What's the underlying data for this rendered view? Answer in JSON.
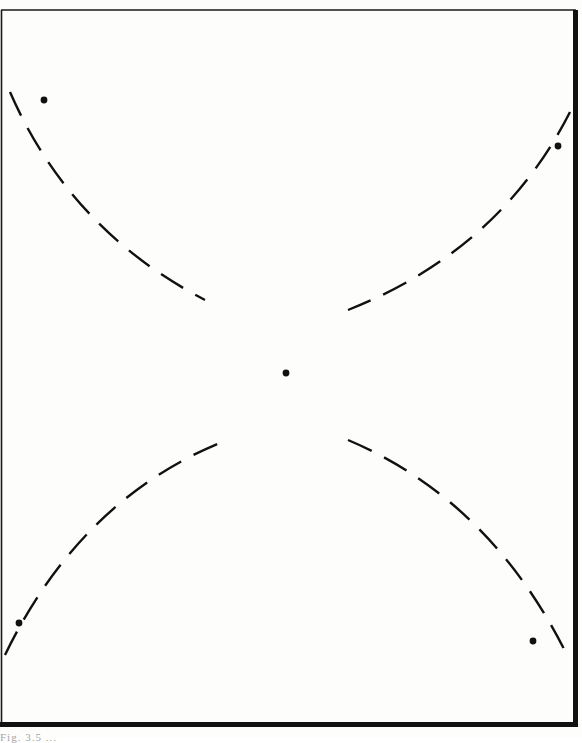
{
  "figure": {
    "caption_fragment": "Fig. 3.5 ...",
    "frame": {
      "left": 1,
      "top": 10,
      "right": 575,
      "bottom": 724
    },
    "colors": {
      "ink": "#111111",
      "paper": "#fdfdfc"
    },
    "curves": [
      {
        "name": "upper-left-arc",
        "d": "M 10 92 Q 70 230 205 300"
      },
      {
        "name": "upper-right-arc",
        "d": "M 570 112 Q 500 250 348 310"
      },
      {
        "name": "lower-left-arc",
        "d": "M 5 655 Q 80 500 222 442"
      },
      {
        "name": "lower-right-arc",
        "d": "M 348 440 Q 490 500 567 655"
      }
    ],
    "dots": [
      {
        "name": "upper-left-point",
        "cx": 44,
        "cy": 100
      },
      {
        "name": "upper-right-point",
        "cx": 558,
        "cy": 146
      },
      {
        "name": "center-point",
        "cx": 286,
        "cy": 373
      },
      {
        "name": "lower-left-point",
        "cx": 19,
        "cy": 623
      },
      {
        "name": "lower-right-point",
        "cx": 533,
        "cy": 641
      }
    ]
  }
}
